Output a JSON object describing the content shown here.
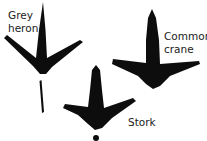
{
  "figure": {
    "ink_color": "#0d0d0d",
    "birds": [
      {
        "name": "Grey heron",
        "label_line1": "Grey",
        "label_line2": "heron"
      },
      {
        "name": "Common crane",
        "label_line1": "Common",
        "label_line2": "crane"
      },
      {
        "name": "Stork",
        "label_line1": "Stork",
        "label_line2": ""
      }
    ]
  }
}
